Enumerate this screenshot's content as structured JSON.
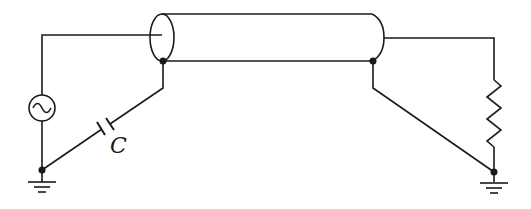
{
  "diagram": {
    "type": "circuit",
    "title": "",
    "components": [
      {
        "id": "source",
        "kind": "ac-voltage-source",
        "label": ""
      },
      {
        "id": "coax",
        "kind": "coaxial-cable",
        "label": ""
      },
      {
        "id": "cap",
        "kind": "capacitor",
        "label": "C"
      },
      {
        "id": "load",
        "kind": "resistor",
        "label": ""
      },
      {
        "id": "gnd-left",
        "kind": "ground",
        "label": ""
      },
      {
        "id": "gnd-right",
        "kind": "ground",
        "label": ""
      }
    ],
    "labels": {
      "capacitor": "C"
    },
    "colors": {
      "line": "#1a1a1a",
      "background": "#ffffff"
    }
  }
}
